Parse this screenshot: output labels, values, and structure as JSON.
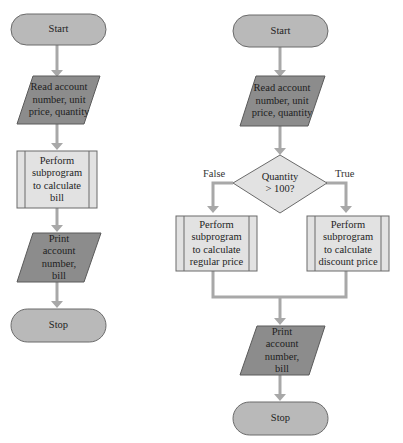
{
  "colors": {
    "terminal_fill": "#b9b9b9",
    "io_fill": "#8c8c8c",
    "process_fill": "#e2e2e2",
    "decision_fill": "#e2e2e2",
    "arrow": "#a8a8a8",
    "outline": "#6a6a6a"
  },
  "left_flowchart": {
    "start": "Start",
    "read": [
      "Read account",
      "number, unit",
      "price, quantity"
    ],
    "process": [
      "Perform",
      "subprogram",
      "to calculate",
      "bill"
    ],
    "print": [
      "Print",
      "account",
      "number,",
      "bill"
    ],
    "stop": "Stop"
  },
  "right_flowchart": {
    "start": "Start",
    "read": [
      "Read account",
      "number, unit",
      "price, quantity"
    ],
    "decision": [
      "Quantity",
      "> 100?"
    ],
    "false_label": "False",
    "true_label": "True",
    "process_false": [
      "Perform",
      "subprogram",
      "to calculate",
      "regular price"
    ],
    "process_true": [
      "Perform",
      "subprogram",
      "to calculate",
      "discount price"
    ],
    "print": [
      "Print",
      "account",
      "number,",
      "bill"
    ],
    "stop": "Stop"
  }
}
